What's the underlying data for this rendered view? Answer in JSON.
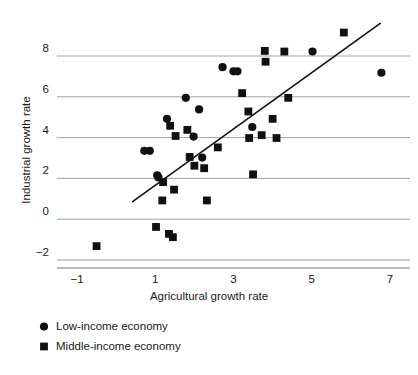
{
  "chart_data": {
    "type": "scatter",
    "title": "",
    "xlabel": "Agricultural growth rate",
    "ylabel": "Industrial growth rate",
    "xlim": [
      -1.6,
      7.4
    ],
    "ylim": [
      -2.6,
      9.4
    ],
    "xticks": [
      -1,
      1,
      3,
      5,
      7
    ],
    "xticklabels": [
      "−1",
      "1",
      "3",
      "5",
      "7"
    ],
    "yticks": [
      -2,
      0,
      2,
      4,
      6,
      8
    ],
    "yticklabels": [
      "−2",
      "0",
      "2",
      "4",
      "6",
      "8"
    ],
    "grid": "horizontal",
    "grid_color": "#999999",
    "legend_position": "below-axes-left",
    "marker_color": "#111111",
    "trendline": {
      "x_start": 0.42,
      "y_start": 0.86,
      "x_end": 6.75,
      "y_end": 9.6,
      "color": "#111111",
      "width": 1.6
    },
    "series": [
      {
        "name": "Low-income economy",
        "marker": "circle",
        "color": "#111111",
        "points": [
          [
            0.72,
            3.35
          ],
          [
            0.86,
            3.35
          ],
          [
            1.05,
            2.15
          ],
          [
            1.08,
            2.05
          ],
          [
            1.3,
            4.92
          ],
          [
            1.78,
            5.95
          ],
          [
            1.98,
            4.05
          ],
          [
            2.12,
            5.38
          ],
          [
            2.2,
            3.02
          ],
          [
            2.72,
            7.45
          ],
          [
            3.0,
            7.25
          ],
          [
            3.1,
            7.25
          ],
          [
            3.48,
            4.52
          ],
          [
            5.02,
            8.22
          ],
          [
            6.78,
            7.18
          ]
        ]
      },
      {
        "name": "Middle-income economy",
        "marker": "square",
        "color": "#111111",
        "points": [
          [
            -0.5,
            -1.32
          ],
          [
            1.02,
            -0.38
          ],
          [
            1.18,
            0.92
          ],
          [
            1.2,
            1.82
          ],
          [
            1.35,
            -0.72
          ],
          [
            1.45,
            -0.88
          ],
          [
            1.48,
            1.45
          ],
          [
            1.38,
            4.58
          ],
          [
            1.52,
            4.08
          ],
          [
            1.82,
            4.38
          ],
          [
            1.88,
            3.05
          ],
          [
            2.0,
            2.62
          ],
          [
            2.25,
            2.5
          ],
          [
            2.32,
            0.92
          ],
          [
            2.6,
            3.52
          ],
          [
            3.22,
            6.18
          ],
          [
            3.38,
            5.28
          ],
          [
            3.4,
            3.98
          ],
          [
            3.5,
            2.2
          ],
          [
            3.72,
            4.12
          ],
          [
            3.8,
            8.25
          ],
          [
            3.82,
            7.72
          ],
          [
            4.0,
            4.92
          ],
          [
            4.1,
            3.98
          ],
          [
            4.3,
            8.22
          ],
          [
            4.4,
            5.95
          ],
          [
            5.82,
            9.15
          ]
        ]
      }
    ]
  },
  "legend": {
    "items": [
      {
        "label": "Low-income economy",
        "marker": "circle"
      },
      {
        "label": "Middle-income economy",
        "marker": "square"
      }
    ]
  }
}
